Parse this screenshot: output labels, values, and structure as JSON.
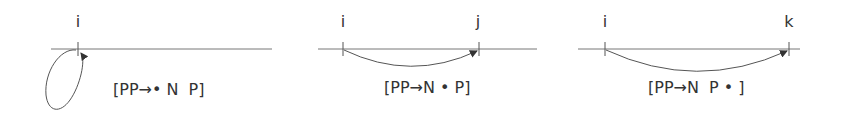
{
  "panels": [
    {
      "nodes": [
        {
          "label": "i",
          "x": 78
        }
      ],
      "item": "[PP→• N  P]",
      "arc": "self-loop"
    },
    {
      "nodes": [
        {
          "label": "i",
          "x": 343
        },
        {
          "label": "j",
          "x": 479
        }
      ],
      "item": "[PP→N • P]",
      "arc": "i-to-j"
    },
    {
      "nodes": [
        {
          "label": "i",
          "x": 605
        },
        {
          "label": "k",
          "x": 789
        }
      ],
      "item": "[PP→N  P • ]",
      "arc": "i-to-k"
    }
  ],
  "colors": {
    "line": "#555555",
    "text": "#333333"
  }
}
